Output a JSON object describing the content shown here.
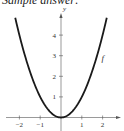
{
  "caption": "Sample answer:",
  "chart_data": {
    "type": "line",
    "title": "",
    "xlabel": "",
    "ylabel": "y",
    "xlim": [
      -2.2,
      2.7
    ],
    "ylim": [
      0,
      5
    ],
    "x_ticks": [
      -2,
      -1,
      1,
      2
    ],
    "y_ticks": [
      1,
      2,
      3,
      4
    ],
    "grid": false,
    "legend": "none",
    "series": [
      {
        "name": "f",
        "function": "x^2",
        "x": [
          -2.2,
          -2,
          -1.5,
          -1,
          -0.5,
          0,
          0.5,
          1,
          1.5,
          2,
          2.2
        ],
        "y": [
          4.84,
          4,
          2.25,
          1,
          0.25,
          0,
          0.25,
          1,
          2.25,
          4,
          4.84
        ]
      }
    ],
    "annotations": [
      {
        "text": "f",
        "x": 1.9,
        "y": 2.8
      }
    ]
  },
  "colors": {
    "curve": "#1a1a1a",
    "axis": "#555555",
    "text": "#333333"
  }
}
